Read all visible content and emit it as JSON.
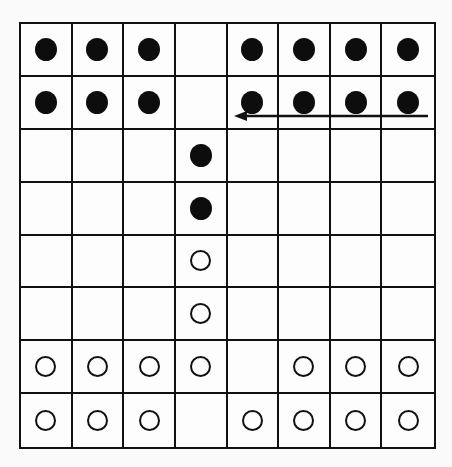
{
  "diagram": {
    "type": "game-board",
    "rows": 8,
    "cols": 8,
    "line_color": "#111111",
    "background": "#fafafa",
    "legend": {
      "B": "black-piece",
      "W": "white-piece",
      ".": "empty"
    },
    "board": [
      [
        "B",
        "B",
        "B",
        ".",
        "B",
        "B",
        "B",
        "B"
      ],
      [
        "B",
        "B",
        "B",
        ".",
        "B",
        "B",
        "B",
        "B"
      ],
      [
        ".",
        ".",
        ".",
        "B",
        ".",
        ".",
        ".",
        "."
      ],
      [
        ".",
        ".",
        ".",
        "B",
        ".",
        ".",
        ".",
        "."
      ],
      [
        ".",
        ".",
        ".",
        "W",
        ".",
        ".",
        ".",
        "."
      ],
      [
        ".",
        ".",
        ".",
        "W",
        ".",
        ".",
        ".",
        "."
      ],
      [
        "W",
        "W",
        "W",
        "W",
        ".",
        "W",
        "W",
        "W"
      ],
      [
        "W",
        "W",
        "W",
        ".",
        "W",
        "W",
        "W",
        "W"
      ]
    ],
    "arrows": [
      {
        "row": 1,
        "from_col": 7,
        "to_col": 4,
        "direction": "left",
        "position": "bottom-of-row"
      }
    ]
  }
}
